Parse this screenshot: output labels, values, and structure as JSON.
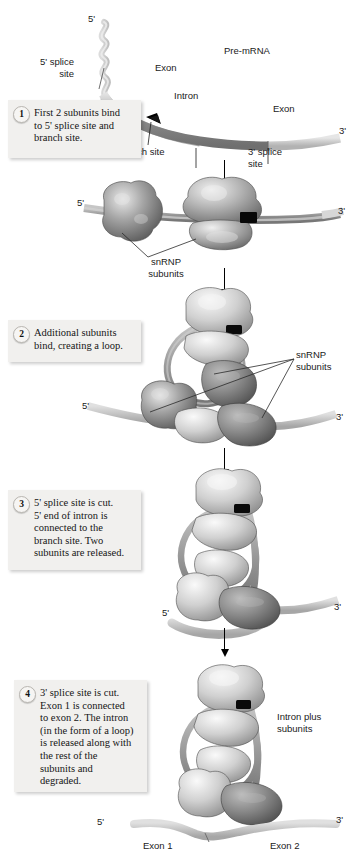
{
  "figure": {
    "background": "#ffffff",
    "colors": {
      "intron": "#8d8d8d",
      "exon": "#c9c9c9",
      "snrnp_light": "#d8d8d8",
      "snrnp_mid": "#9a9a9a",
      "snrnp_dark": "#6d6d6d",
      "branch_site": "#000000",
      "callout_bg": "#f1f0ee",
      "text": "#1a1a1a"
    }
  },
  "steps": [
    {
      "number": "1",
      "text": "First 2 subunits bind\nto 5' splice site and\nbranch site."
    },
    {
      "number": "2",
      "text": "Additional subunits\nbind, creating a loop."
    },
    {
      "number": "3",
      "text": "5' splice site is cut.\n5' end of intron is\nconnected to the\nbranch site. Two\nsubunits are released."
    },
    {
      "number": "4",
      "text": "3' splice site is cut.\nExon 1 is connected\nto exon 2. The intron\n(in the form of a loop)\nis released along with\nthe rest of the\nsubunits and\ndegraded."
    }
  ],
  "panel1": {
    "five_prime": "5'",
    "three_prime": "3'",
    "molecule": "Pre-mRNA",
    "exon_left": "Exon",
    "exon_right": "Exon",
    "intron": "Intron",
    "five_splice_site": "5' splice\nsite",
    "three_splice_site": "3' splice\nsite",
    "branch_site": "Branch site"
  },
  "panel2": {
    "five_prime": "5'",
    "three_prime": "3'",
    "snrnp": "snRNP\nsubunits"
  },
  "panel3": {
    "five_prime": "5'",
    "three_prime": "3'",
    "snrnp": "snRNP\nsubunits"
  },
  "panel4": {
    "five_prime": "5'",
    "three_prime": "3'"
  },
  "panel5": {
    "five_prime": "5'",
    "three_prime": "3'",
    "intron_plus_subunits": "Intron plus\nsubunits",
    "exon1": "Exon 1",
    "exon2": "Exon 2"
  }
}
